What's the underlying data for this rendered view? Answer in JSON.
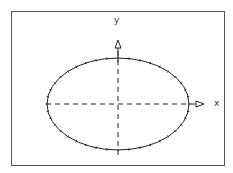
{
  "diagram": {
    "type": "ellipse-with-axes",
    "axes": {
      "x_label": "x",
      "y_label": "y"
    },
    "ellipse": {
      "cx": 118,
      "cy": 104,
      "rx": 71,
      "ry": 46,
      "tick_marks": 40
    },
    "colors": {
      "line": "#222222",
      "frame": "#555555",
      "background": "#ffffff"
    }
  }
}
